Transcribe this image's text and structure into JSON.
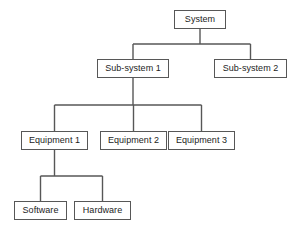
{
  "diagram": {
    "type": "hierarchy-tree",
    "stroke_color": "#575757",
    "text_color": "#1c1c1c",
    "background_color": "#ffffff",
    "nodes": [
      {
        "id": "system",
        "label": "System",
        "level": 0,
        "x": 174,
        "y": 10,
        "w": 52,
        "h": 19
      },
      {
        "id": "subsystem1",
        "label": "Sub-system 1",
        "level": 1,
        "x": 97,
        "y": 59,
        "w": 72,
        "h": 19
      },
      {
        "id": "subsystem2",
        "label": "Sub-system 2",
        "level": 1,
        "x": 214,
        "y": 59,
        "w": 73,
        "h": 19
      },
      {
        "id": "equipment1",
        "label": "Equipment 1",
        "level": 2,
        "x": 21,
        "y": 131,
        "w": 67,
        "h": 19
      },
      {
        "id": "equipment2",
        "label": "Equipment 2",
        "level": 2,
        "x": 100,
        "y": 131,
        "w": 67,
        "h": 19
      },
      {
        "id": "equipment3",
        "label": "Equipment 3",
        "level": 2,
        "x": 168,
        "y": 131,
        "w": 67,
        "h": 19
      },
      {
        "id": "software",
        "label": "Software",
        "level": 3,
        "x": 14,
        "y": 201,
        "w": 53,
        "h": 19
      },
      {
        "id": "hardware",
        "label": "Hardware",
        "level": 3,
        "x": 74,
        "y": 201,
        "w": 57,
        "h": 19
      }
    ],
    "edges": [
      {
        "from": "system",
        "to": "subsystem1"
      },
      {
        "from": "system",
        "to": "subsystem2"
      },
      {
        "from": "subsystem1",
        "to": "equipment1"
      },
      {
        "from": "subsystem1",
        "to": "equipment2"
      },
      {
        "from": "subsystem1",
        "to": "equipment3"
      },
      {
        "from": "equipment1",
        "to": "software"
      },
      {
        "from": "equipment1",
        "to": "hardware"
      }
    ]
  }
}
